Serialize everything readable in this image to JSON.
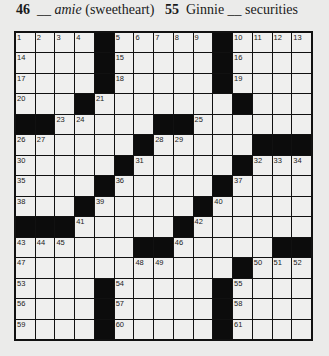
{
  "header_clues": [
    {
      "number": "46",
      "before": "__ ",
      "italic": "amie",
      "after": " (sweetheart)"
    },
    {
      "number": "55",
      "before": "Ginnie __ securities",
      "italic": "",
      "after": ""
    }
  ],
  "grid": {
    "rows": 15,
    "cols": 15,
    "layout": [
      "....#.....#....",
      "....#.....#....",
      "....#.....#....",
      "...#.......#...",
      "##.....##......",
      "......#.....###",
      ".....#.....#...",
      "....#.....#....",
      "...#.....#.....",
      "###.....#......",
      "......##.....##",
      "...........#...",
      "....#.....#....",
      "....#.....#....",
      "....#.....#...."
    ],
    "numbers": {
      "0,0": "1",
      "0,1": "2",
      "0,2": "3",
      "0,3": "4",
      "0,5": "5",
      "0,6": "6",
      "0,7": "7",
      "0,8": "8",
      "0,9": "9",
      "0,11": "10",
      "0,12": "11",
      "0,13": "12",
      "0,14": "13",
      "1,0": "14",
      "1,5": "15",
      "1,11": "16",
      "2,0": "17",
      "2,5": "18",
      "2,11": "19",
      "3,0": "20",
      "3,4": "21",
      "3,11": "22",
      "4,2": "23",
      "4,3": "24",
      "4,9": "25",
      "5,0": "26",
      "5,1": "27",
      "5,7": "28",
      "5,8": "29",
      "6,0": "30",
      "6,6": "31",
      "6,12": "32",
      "6,13": "33",
      "6,14": "34",
      "7,0": "35",
      "7,5": "36",
      "7,11": "37",
      "8,0": "38",
      "8,4": "39",
      "8,10": "40",
      "9,3": "41",
      "9,9": "42",
      "10,0": "43",
      "10,1": "44",
      "10,2": "45",
      "10,8": "46",
      "11,0": "47",
      "11,6": "48",
      "11,7": "49",
      "11,12": "50",
      "11,13": "51",
      "11,14": "52",
      "12,0": "53",
      "12,5": "54",
      "12,11": "55",
      "13,0": "56",
      "13,5": "57",
      "13,11": "58",
      "14,0": "59",
      "14,5": "60",
      "14,11": "61"
    }
  }
}
